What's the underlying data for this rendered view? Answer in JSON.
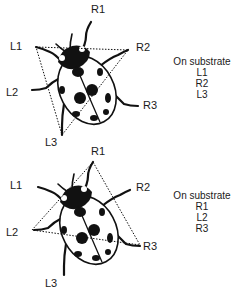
{
  "panels": [
    {
      "id": "top",
      "legs": {
        "R1": "R1",
        "L1": "L1",
        "R2": "R2",
        "L2": "L2",
        "R3": "R3",
        "L3": "L3"
      },
      "legend": {
        "title": "On substrate",
        "items": [
          "L1",
          "R2",
          "L3"
        ]
      },
      "tripod": [
        "L1",
        "R2",
        "L3"
      ]
    },
    {
      "id": "bottom",
      "legs": {
        "R1": "R1",
        "L1": "L1",
        "R2": "R2",
        "L2": "L2",
        "R3": "R3",
        "L3": "L3"
      },
      "legend": {
        "title": "On substrate",
        "items": [
          "R1",
          "L2",
          "R3"
        ]
      },
      "tripod": [
        "R1",
        "L2",
        "R3"
      ]
    }
  ],
  "colors": {
    "ink": "#111111",
    "background": "#ffffff"
  }
}
